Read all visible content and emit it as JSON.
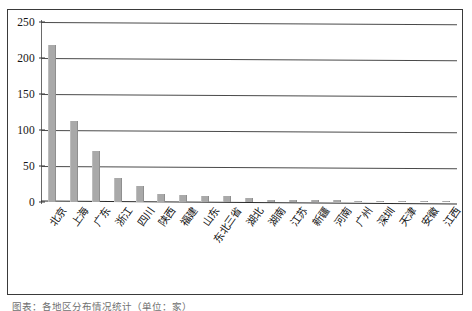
{
  "chart_data": {
    "type": "bar",
    "title": "",
    "subtitle": "",
    "xlabel": "",
    "ylabel": "",
    "ylim": [
      0,
      250
    ],
    "yticks": [
      0,
      50,
      100,
      150,
      200,
      250
    ],
    "ytick_labels": [
      "0",
      "50",
      "100",
      "150",
      "200",
      "250"
    ],
    "grid": true,
    "legend": null,
    "bar_color": "#a9a9a9",
    "categories": [
      "北京",
      "上海",
      "广东",
      "浙江",
      "四川",
      "陕西",
      "福建",
      "山东",
      "东北三省",
      "湖北",
      "湖南",
      "江苏",
      "新疆",
      "河南",
      "广州",
      "深圳",
      "天津",
      "安徽",
      "江西"
    ],
    "values": [
      218,
      113,
      71,
      33,
      22,
      11,
      10,
      9,
      8,
      5,
      3,
      3,
      3,
      3,
      2,
      2,
      1,
      1,
      1
    ],
    "series": [
      {
        "name": "数量",
        "values": [
          218,
          113,
          71,
          33,
          22,
          11,
          10,
          9,
          8,
          5,
          3,
          3,
          3,
          3,
          2,
          2,
          1,
          1,
          1
        ]
      }
    ]
  },
  "axis": {
    "y_ticks": [
      "250",
      "200",
      "150",
      "100",
      "50",
      "0"
    ]
  },
  "caption": {
    "text": "图表：各地区分布情况统计（单位：家）"
  }
}
